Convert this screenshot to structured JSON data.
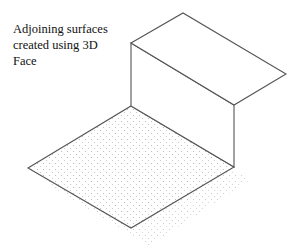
{
  "caption": {
    "lines": [
      "Adjoining surfaces",
      "created using 3D",
      "Face"
    ]
  },
  "colors": {
    "line": "#555555",
    "dot": "#b5b5b5",
    "text": "#111111",
    "background": "#ffffff"
  },
  "surfaces": {
    "top_face": "Top horizontal 3D face",
    "wall_face": "Vertical 3D face",
    "floor_face": "Dotted horizontal 3D face"
  }
}
